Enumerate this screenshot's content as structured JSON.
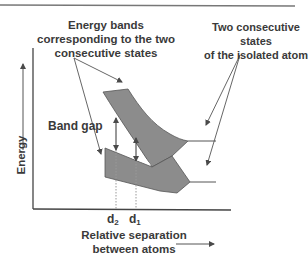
{
  "diagram": {
    "labels": {
      "energy_bands_line1": "Energy bands",
      "energy_bands_line2": "corresponding to the two",
      "energy_bands_line3": "consecutive states",
      "isolated_states_line1": "Two consecutive states",
      "isolated_states_line2": "of the isolated atom",
      "band_gap": "Band gap",
      "y_axis": "Energy",
      "x_axis_line1": "Relative separation",
      "x_axis_line2": "between atoms",
      "d2_base": "d",
      "d2_sub": "2",
      "d1_base": "d",
      "d1_sub": "1"
    },
    "colors": {
      "band_fill": "#8c8c8c",
      "line": "#4a4a4a",
      "text": "#3a3a3a",
      "top_rule": "#777777"
    }
  }
}
